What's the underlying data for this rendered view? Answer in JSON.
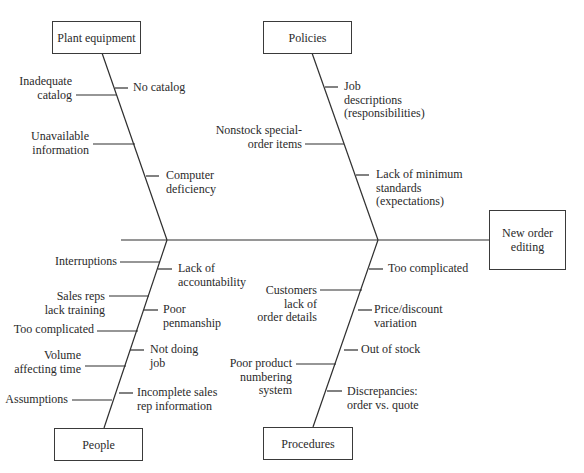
{
  "effect": {
    "label": "New order\nediting"
  },
  "categories": {
    "plant_equipment": {
      "label": "Plant equipment",
      "causes_left": [
        "Inadequate\ncatalog",
        "Unavailable\ninformation"
      ],
      "causes_right": [
        "No catalog",
        "Computer\ndeficiency"
      ]
    },
    "policies": {
      "label": "Policies",
      "causes_left": [
        "Nonstock special-\norder items"
      ],
      "causes_right": [
        "Job\ndescriptions\n(responsibilities)",
        "Lack of minimum\nstandards\n(expectations)"
      ]
    },
    "people": {
      "label": "People",
      "causes_left": [
        "Interruptions",
        "Sales reps\nlack training",
        "Too complicated",
        "Volume\naffecting time",
        "Assumptions"
      ],
      "causes_right": [
        "Lack of\naccountability",
        "Poor\npenmanship",
        "Not doing\njob",
        "Incomplete sales\nrep information"
      ]
    },
    "procedures": {
      "label": "Procedures",
      "causes_left": [
        "Customers\nlack of\norder details",
        "Poor product\nnumbering\nsystem"
      ],
      "causes_right": [
        "Too complicated",
        "Price/discount\nvariation",
        "Out of stock",
        "Discrepancies:\norder vs. quote"
      ]
    }
  },
  "colors": {
    "line": "#2e2e2e",
    "text": "#2a2a2a",
    "background": "#ffffff"
  }
}
